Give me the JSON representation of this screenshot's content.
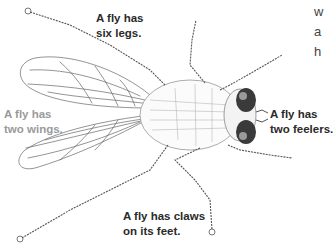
{
  "labels": {
    "legs": {
      "line1": "A fly has",
      "line2": "six legs."
    },
    "wings": {
      "line1": "A fly has",
      "line2": "two wings."
    },
    "feelers": {
      "line1": "A fly has",
      "line2": "two feelers."
    },
    "claws": {
      "line1": "A fly has claws",
      "line2": "on its feet."
    }
  },
  "side_text": [
    "w",
    "a",
    "h"
  ],
  "colors": {
    "ink": "#2a2a2a",
    "faded_label": "#9a9a9a",
    "eye": "#3a3a3a",
    "line": "#555555"
  }
}
